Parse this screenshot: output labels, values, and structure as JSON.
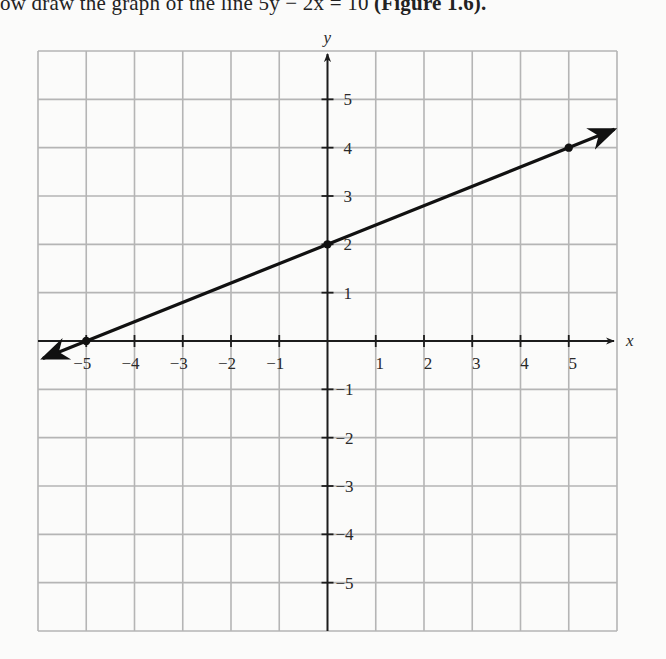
{
  "caption": {
    "prefix": "ow draw the graph of the line 5y − 2x = 10 ",
    "figure_ref": "(Figure 1.6)."
  },
  "chart_data": {
    "type": "line",
    "title": "",
    "xlabel": "x",
    "ylabel": "y",
    "xlim": [
      -6,
      6
    ],
    "ylim": [
      -6,
      6
    ],
    "grid": true,
    "x_ticks": [
      -5,
      -4,
      -3,
      -2,
      -1,
      1,
      2,
      3,
      4,
      5
    ],
    "y_ticks": [
      -5,
      -4,
      -3,
      -2,
      -1,
      1,
      2,
      3,
      4,
      5
    ],
    "x_tick_labels": [
      "−5",
      "−4",
      "−3",
      "−2",
      "−1",
      "1",
      "2",
      "3",
      "4",
      "5"
    ],
    "y_tick_labels": [
      "−5",
      "−4",
      "−3",
      "−2",
      "−1",
      "1",
      "2",
      "3",
      "4",
      "5"
    ],
    "series": [
      {
        "name": "5y − 2x = 10",
        "equation": "y = 0.4x + 2",
        "marked_points": [
          [
            -5,
            0
          ],
          [
            0,
            2
          ],
          [
            5,
            4
          ]
        ],
        "extends_with_arrows": true
      }
    ],
    "legend": null
  },
  "colors": {
    "grid": "#b5b5b5",
    "axis": "#1c1c1c",
    "line": "#111111",
    "background": "#fbfbfa"
  }
}
